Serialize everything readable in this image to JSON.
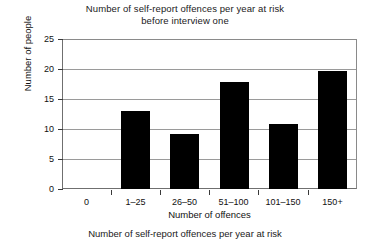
{
  "chart_data": {
    "type": "bar",
    "title": "Number of self-report offences per year at risk before interview one",
    "title_line1": "Number of self-report offences per year at risk",
    "title_line2": "before interview one",
    "xlabel": "Number of offences",
    "ylabel": "Number of people",
    "categories": [
      "0",
      "1–25",
      "26–50",
      "51–100",
      "101–150",
      "150+"
    ],
    "values": [
      0,
      13,
      9.2,
      17.8,
      10.8,
      19.7
    ],
    "ylim": [
      0,
      25
    ],
    "yticks": [
      0,
      5,
      10,
      15,
      20,
      25
    ],
    "ytick_labels": [
      "0",
      "5",
      "10",
      "15",
      "20",
      "25"
    ],
    "grid": "horizontal",
    "legend": "none",
    "bar_color": "#000000",
    "grid_color": "#9a9a9a",
    "axis_color": "#6f6f6f"
  },
  "caption": "Number of self-report offences per year at risk"
}
